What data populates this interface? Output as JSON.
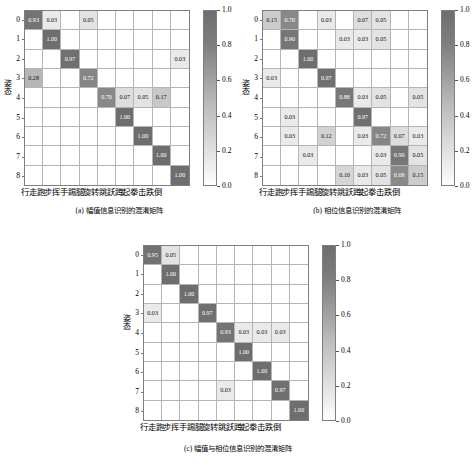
{
  "figure": {
    "class_labels_cn": [
      "行走",
      "跑步",
      "挥手",
      "踢腿",
      "旋转",
      "跳跃",
      "蹲起",
      "拳击",
      "跌倒"
    ],
    "xlabel": "行走跑步挥手踢腿旋转跳跃蹲起拳击跌倒",
    "ylabel": "姿态",
    "tick_labels": [
      "0",
      "1",
      "2",
      "3",
      "4",
      "5",
      "6",
      "7",
      "8"
    ],
    "colorbar_ticks": [
      "1.0",
      "0.8",
      "0.6",
      "0.4",
      "0.2",
      "0.0"
    ],
    "colorbar_range": [
      0.0,
      1.0
    ],
    "accent_dark": "#6e6e6e",
    "accent_light": "#ffffff"
  },
  "panels": [
    {
      "id": "a",
      "caption": "(a) 幅值信息识别的混淆矩阵"
    },
    {
      "id": "b",
      "caption": "(b) 相位信息识别的混淆矩阵"
    },
    {
      "id": "c",
      "caption": "(c) 幅值与相位信息识别的混淆矩阵"
    }
  ],
  "chart_data": [
    {
      "type": "heatmap",
      "title": "(a) 幅值信息识别的混淆矩阵",
      "xlabel": "行走跑步挥手踢腿旋转跳跃蹲起拳击跌倒",
      "ylabel": "姿态",
      "x_categories": [
        "行走",
        "跑步",
        "挥手",
        "踢腿",
        "旋转",
        "跳跃",
        "蹲起",
        "拳击",
        "跌倒"
      ],
      "y_categories": [
        "0",
        "1",
        "2",
        "3",
        "4",
        "5",
        "6",
        "7",
        "8"
      ],
      "zlim": [
        0.0,
        1.0
      ],
      "colorbar_ticks": [
        1.0,
        0.8,
        0.6,
        0.4,
        0.2,
        0.0
      ],
      "values": [
        [
          0.93,
          0.03,
          0.0,
          0.05,
          0.0,
          0.0,
          0.0,
          0.0,
          0.0
        ],
        [
          0.0,
          1.0,
          0.0,
          0.0,
          0.0,
          0.0,
          0.0,
          0.0,
          0.0
        ],
        [
          0.0,
          0.0,
          0.97,
          0.0,
          0.0,
          0.0,
          0.0,
          0.0,
          0.03
        ],
        [
          0.28,
          0.0,
          0.0,
          0.72,
          0.0,
          0.0,
          0.0,
          0.0,
          0.0
        ],
        [
          0.0,
          0.0,
          0.0,
          0.0,
          0.7,
          0.07,
          0.05,
          0.17,
          0.0
        ],
        [
          0.0,
          0.0,
          0.0,
          0.0,
          0.0,
          1.0,
          0.0,
          0.0,
          0.0
        ],
        [
          0.0,
          0.0,
          0.0,
          0.0,
          0.0,
          0.0,
          1.0,
          0.0,
          0.0
        ],
        [
          0.0,
          0.0,
          0.0,
          0.0,
          0.0,
          0.0,
          0.0,
          1.0,
          0.0
        ],
        [
          0.0,
          0.0,
          0.0,
          0.0,
          0.0,
          0.0,
          0.0,
          0.0,
          1.0
        ]
      ]
    },
    {
      "type": "heatmap",
      "title": "(b) 相位信息识别的混淆矩阵",
      "xlabel": "行走跑步挥手踢腿旋转跳跃蹲起拳击跌倒",
      "ylabel": "姿态",
      "x_categories": [
        "行走",
        "跑步",
        "挥手",
        "踢腿",
        "旋转",
        "跳跃",
        "蹲起",
        "拳击",
        "跌倒"
      ],
      "y_categories": [
        "0",
        "1",
        "2",
        "3",
        "4",
        "5",
        "6",
        "7",
        "8"
      ],
      "zlim": [
        0.0,
        1.0
      ],
      "colorbar_ticks": [
        1.0,
        0.8,
        0.6,
        0.4,
        0.2,
        0.0
      ],
      "values": [
        [
          0.15,
          0.7,
          0.0,
          0.03,
          0.0,
          0.07,
          0.05,
          0.0,
          0.0
        ],
        [
          0.0,
          0.9,
          0.0,
          0.0,
          0.03,
          0.03,
          0.05,
          0.0,
          0.0
        ],
        [
          0.0,
          0.0,
          1.0,
          0.0,
          0.0,
          0.0,
          0.0,
          0.0,
          0.0
        ],
        [
          0.03,
          0.0,
          0.0,
          0.97,
          0.0,
          0.0,
          0.0,
          0.0,
          0.0
        ],
        [
          0.0,
          0.0,
          0.0,
          0.0,
          0.88,
          0.03,
          0.05,
          0.0,
          0.05
        ],
        [
          0.0,
          0.03,
          0.0,
          0.0,
          0.0,
          0.97,
          0.0,
          0.0,
          0.0
        ],
        [
          0.0,
          0.03,
          0.0,
          0.12,
          0.0,
          0.03,
          0.72,
          0.07,
          0.03
        ],
        [
          0.0,
          0.0,
          0.03,
          0.0,
          0.0,
          0.0,
          0.03,
          0.9,
          0.05
        ],
        [
          0.0,
          0.0,
          0.0,
          0.0,
          0.1,
          0.03,
          0.05,
          0.68,
          0.15
        ]
      ]
    },
    {
      "type": "heatmap",
      "title": "(c) 幅值与相位信息识别的混淆矩阵",
      "xlabel": "行走跑步挥手踢腿旋转跳跃蹲起拳击跌倒",
      "ylabel": "姿态",
      "x_categories": [
        "行走",
        "跑步",
        "挥手",
        "踢腿",
        "旋转",
        "跳跃",
        "蹲起",
        "拳击",
        "跌倒"
      ],
      "y_categories": [
        "0",
        "1",
        "2",
        "3",
        "4",
        "5",
        "6",
        "7",
        "8"
      ],
      "zlim": [
        0.0,
        1.0
      ],
      "colorbar_ticks": [
        1.0,
        0.8,
        0.6,
        0.4,
        0.2,
        0.0
      ],
      "values": [
        [
          0.95,
          0.05,
          0.0,
          0.0,
          0.0,
          0.0,
          0.0,
          0.0,
          0.0
        ],
        [
          0.0,
          1.0,
          0.0,
          0.0,
          0.0,
          0.0,
          0.0,
          0.0,
          0.0
        ],
        [
          0.0,
          0.0,
          1.0,
          0.0,
          0.0,
          0.0,
          0.0,
          0.0,
          0.0
        ],
        [
          0.03,
          0.0,
          0.0,
          0.97,
          0.0,
          0.0,
          0.0,
          0.0,
          0.0
        ],
        [
          0.0,
          0.0,
          0.0,
          0.0,
          0.93,
          0.03,
          0.03,
          0.03,
          0.0
        ],
        [
          0.0,
          0.0,
          0.0,
          0.0,
          0.0,
          1.0,
          0.0,
          0.0,
          0.0
        ],
        [
          0.0,
          0.0,
          0.0,
          0.0,
          0.0,
          0.0,
          1.0,
          0.0,
          0.0
        ],
        [
          0.0,
          0.0,
          0.0,
          0.0,
          0.03,
          0.0,
          0.0,
          0.97,
          0.0
        ],
        [
          0.0,
          0.0,
          0.0,
          0.0,
          0.0,
          0.0,
          0.0,
          0.0,
          1.0
        ]
      ]
    }
  ]
}
